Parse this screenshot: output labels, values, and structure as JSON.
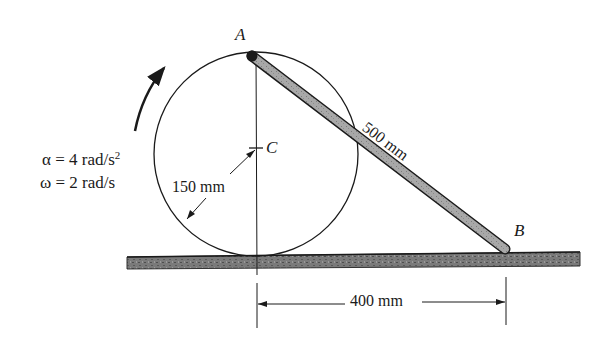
{
  "diagram": {
    "type": "mechanism",
    "points": {
      "A": {
        "label": "A"
      },
      "B": {
        "label": "B"
      },
      "C": {
        "label": "C"
      }
    },
    "disk": {
      "radius_label": "150 mm"
    },
    "rod": {
      "length_label": "500 mm"
    },
    "horizontal_dimension": {
      "label": "400 mm"
    },
    "kinematics": {
      "alpha_symbol": "α",
      "alpha_text": " = 4 rad/s",
      "alpha_exp": "2",
      "omega_symbol": "ω",
      "omega_text": " = 2 rad/s"
    },
    "colors": {
      "line": "#1a1a1a",
      "rod_fill": "#9a9a9a",
      "ground_fill": "#6e6e6e"
    }
  }
}
